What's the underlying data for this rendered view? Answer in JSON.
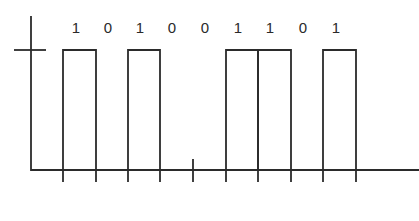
{
  "diagram": {
    "bits": [
      "1",
      "0",
      "1",
      "0",
      "0",
      "1",
      "1",
      "0",
      "1"
    ],
    "bit_boundaries_x": [
      63,
      96,
      128,
      160,
      193,
      226,
      258,
      291,
      323,
      356
    ],
    "label_x": [
      76,
      108,
      140,
      172,
      205,
      238,
      270,
      303,
      336
    ],
    "colors": {
      "line": "#2b2b2b",
      "text": "#2a2a2a",
      "background": "#ffffff"
    }
  }
}
